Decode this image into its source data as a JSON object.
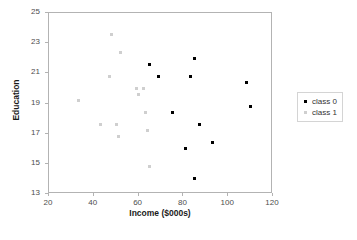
{
  "chart_data": {
    "type": "scatter",
    "title": "",
    "xlabel": "Income ($000s)",
    "ylabel": "Education",
    "xlim": [
      20,
      120
    ],
    "ylim": [
      13,
      25
    ],
    "xticks": [
      20,
      40,
      60,
      80,
      100,
      120
    ],
    "yticks": [
      13,
      15,
      17,
      19,
      21,
      23,
      25
    ],
    "grid": false,
    "legend_position": "right",
    "series": [
      {
        "name": "class 0",
        "color": "#000000",
        "marker": "square",
        "points": [
          {
            "x": 65,
            "y": 21.6
          },
          {
            "x": 69,
            "y": 20.8
          },
          {
            "x": 83,
            "y": 20.8
          },
          {
            "x": 85,
            "y": 22.0
          },
          {
            "x": 108,
            "y": 20.4
          },
          {
            "x": 110,
            "y": 18.8
          },
          {
            "x": 75,
            "y": 18.4
          },
          {
            "x": 87,
            "y": 17.6
          },
          {
            "x": 93,
            "y": 16.4
          },
          {
            "x": 81,
            "y": 16.0
          },
          {
            "x": 85,
            "y": 14.0
          }
        ]
      },
      {
        "name": "class 1",
        "color": "#cfcfcf",
        "marker": "x",
        "points": [
          {
            "x": 33,
            "y": 19.2
          },
          {
            "x": 43,
            "y": 17.6
          },
          {
            "x": 48,
            "y": 23.6
          },
          {
            "x": 52,
            "y": 22.4
          },
          {
            "x": 47,
            "y": 20.8
          },
          {
            "x": 59,
            "y": 20.0
          },
          {
            "x": 62,
            "y": 20.0
          },
          {
            "x": 60,
            "y": 19.6
          },
          {
            "x": 63,
            "y": 18.4
          },
          {
            "x": 64,
            "y": 17.2
          },
          {
            "x": 50,
            "y": 17.6
          },
          {
            "x": 51,
            "y": 16.8
          },
          {
            "x": 65,
            "y": 14.8
          }
        ]
      }
    ]
  },
  "legend": {
    "entries": [
      {
        "label": "class 0"
      },
      {
        "label": "class 1"
      }
    ]
  },
  "axes": {
    "x_title": "Income ($000s)",
    "y_title": "Education",
    "x_tick_labels": [
      "20",
      "40",
      "60",
      "80",
      "100",
      "120"
    ],
    "y_tick_labels": [
      "13",
      "15",
      "17",
      "19",
      "21",
      "23",
      "25"
    ]
  },
  "colors": {
    "class0": "#000000",
    "class1": "#cfcfcf",
    "frame": "#b3b3b3",
    "text": "#333333",
    "background": "#ffffff"
  }
}
